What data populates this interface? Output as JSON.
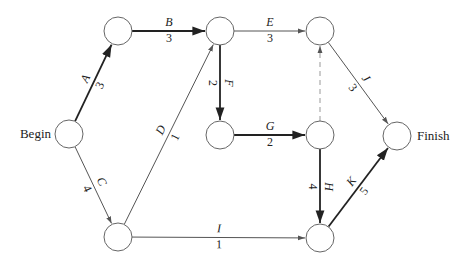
{
  "diagram": {
    "type": "activity-on-arrow network",
    "nodes": [
      {
        "id": "begin",
        "x": 69,
        "y": 134,
        "label": "Begin",
        "label_side": "left"
      },
      {
        "id": "n2",
        "x": 118,
        "y": 31,
        "label": ""
      },
      {
        "id": "n3",
        "x": 220,
        "y": 31,
        "label": ""
      },
      {
        "id": "n4",
        "x": 320,
        "y": 31,
        "label": ""
      },
      {
        "id": "n5",
        "x": 220,
        "y": 135,
        "label": ""
      },
      {
        "id": "n6",
        "x": 320,
        "y": 135,
        "label": ""
      },
      {
        "id": "finish",
        "x": 397,
        "y": 136,
        "label": "Finish",
        "label_side": "right"
      },
      {
        "id": "n7",
        "x": 118,
        "y": 237,
        "label": ""
      },
      {
        "id": "n8",
        "x": 320,
        "y": 238,
        "label": ""
      }
    ],
    "edges": [
      {
        "activity": "A",
        "duration": "3",
        "from": "begin",
        "to": "n2",
        "critical": true
      },
      {
        "activity": "B",
        "duration": "3",
        "from": "n2",
        "to": "n3",
        "critical": true
      },
      {
        "activity": "C",
        "duration": "4",
        "from": "begin",
        "to": "n7",
        "critical": false
      },
      {
        "activity": "D",
        "duration": "1",
        "from": "n7",
        "to": "n3",
        "critical": false
      },
      {
        "activity": "E",
        "duration": "3",
        "from": "n3",
        "to": "n4",
        "critical": false
      },
      {
        "activity": "F",
        "duration": "2",
        "from": "n3",
        "to": "n5",
        "critical": true
      },
      {
        "activity": "G",
        "duration": "2",
        "from": "n5",
        "to": "n6",
        "critical": true
      },
      {
        "activity": "H",
        "duration": "4",
        "from": "n6",
        "to": "n8",
        "critical": true
      },
      {
        "activity": "I",
        "duration": "1",
        "from": "n7",
        "to": "n8",
        "critical": false
      },
      {
        "activity": "J",
        "duration": "3",
        "from": "n4",
        "to": "finish",
        "critical": false
      },
      {
        "activity": "K",
        "duration": "5",
        "from": "n8",
        "to": "finish",
        "critical": true
      },
      {
        "activity": "",
        "duration": "",
        "from": "n6",
        "to": "n4",
        "dummy": true
      }
    ],
    "colors": {
      "critical_edge": "#222222",
      "normal_edge": "#555555",
      "dummy_edge": "#999999",
      "node_stroke": "#666666"
    }
  }
}
